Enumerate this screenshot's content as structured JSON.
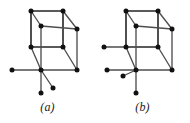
{
  "plate": {
    "background_color": "#ffffff",
    "edge_color": "#4e4e4e",
    "edge_color_dark": "#242424",
    "vertex_color": "#111111"
  },
  "figures": [
    {
      "id": "a",
      "caption": "(a)",
      "description": "Cube graph with three pendant edges at the front-bottom-left vertex",
      "vertex_count": 11,
      "edge_count": 15,
      "vertices": [
        {
          "name": "back-top-left",
          "x": 31,
          "y": 11
        },
        {
          "name": "back-top-right",
          "x": 63,
          "y": 11
        },
        {
          "name": "front-top-left",
          "x": 41,
          "y": 26
        },
        {
          "name": "front-top-right",
          "x": 77,
          "y": 29
        },
        {
          "name": "back-bottom-left",
          "x": 31,
          "y": 47
        },
        {
          "name": "back-bottom-right",
          "x": 63,
          "y": 47
        },
        {
          "name": "front-bottom-left",
          "x": 41,
          "y": 70
        },
        {
          "name": "front-bottom-right",
          "x": 77,
          "y": 70
        },
        {
          "name": "pendant-left",
          "x": 12,
          "y": 70
        },
        {
          "name": "pendant-down",
          "x": 41,
          "y": 93
        },
        {
          "name": "pendant-diagonal",
          "x": 53,
          "y": 88
        }
      ],
      "edges": [
        [
          "back-top-left",
          "back-top-right"
        ],
        [
          "back-top-left",
          "back-bottom-left"
        ],
        [
          "back-top-right",
          "back-bottom-right"
        ],
        [
          "back-bottom-left",
          "back-bottom-right"
        ],
        [
          "front-top-left",
          "front-top-right"
        ],
        [
          "front-top-left",
          "front-bottom-left"
        ],
        [
          "front-top-right",
          "front-bottom-right"
        ],
        [
          "front-bottom-left",
          "front-bottom-right"
        ],
        [
          "back-top-left",
          "front-top-left"
        ],
        [
          "back-top-right",
          "front-top-right"
        ],
        [
          "back-bottom-left",
          "front-bottom-left"
        ],
        [
          "back-bottom-right",
          "front-bottom-right"
        ],
        [
          "front-bottom-left",
          "pendant-left"
        ],
        [
          "front-bottom-left",
          "pendant-down"
        ],
        [
          "front-bottom-left",
          "pendant-diagonal"
        ]
      ]
    },
    {
      "id": "b",
      "caption": "(b)",
      "description": "Cube graph with one pendant edge at the back-bottom-left vertex and three pendant edges at the front-bottom-left vertex",
      "vertex_count": 12,
      "edge_count": 16,
      "vertices": [
        {
          "name": "back-top-left",
          "x": 31,
          "y": 11
        },
        {
          "name": "back-top-right",
          "x": 63,
          "y": 11
        },
        {
          "name": "front-top-left",
          "x": 41,
          "y": 26
        },
        {
          "name": "front-top-right",
          "x": 77,
          "y": 29
        },
        {
          "name": "back-bottom-left",
          "x": 31,
          "y": 47
        },
        {
          "name": "back-bottom-right",
          "x": 63,
          "y": 47
        },
        {
          "name": "front-bottom-left",
          "x": 41,
          "y": 70
        },
        {
          "name": "front-bottom-right",
          "x": 77,
          "y": 70
        },
        {
          "name": "pendant-upper-left",
          "x": 9,
          "y": 47
        },
        {
          "name": "pendant-lower-left",
          "x": 12,
          "y": 70
        },
        {
          "name": "pendant-short-down",
          "x": 28,
          "y": 76
        },
        {
          "name": "pendant-long-down",
          "x": 41,
          "y": 93
        }
      ],
      "edges": [
        [
          "back-top-left",
          "back-top-right"
        ],
        [
          "back-top-left",
          "back-bottom-left"
        ],
        [
          "back-top-right",
          "back-bottom-right"
        ],
        [
          "back-bottom-left",
          "back-bottom-right"
        ],
        [
          "front-top-left",
          "front-top-right"
        ],
        [
          "front-top-left",
          "front-bottom-left"
        ],
        [
          "front-top-right",
          "front-bottom-right"
        ],
        [
          "front-bottom-left",
          "front-bottom-right"
        ],
        [
          "back-top-left",
          "front-top-left"
        ],
        [
          "back-top-right",
          "front-top-right"
        ],
        [
          "back-bottom-left",
          "front-bottom-left"
        ],
        [
          "back-bottom-right",
          "front-bottom-right"
        ],
        [
          "back-bottom-left",
          "pendant-upper-left"
        ],
        [
          "front-bottom-left",
          "pendant-lower-left"
        ],
        [
          "front-bottom-left",
          "pendant-short-down"
        ],
        [
          "front-bottom-left",
          "pendant-long-down"
        ]
      ]
    }
  ]
}
